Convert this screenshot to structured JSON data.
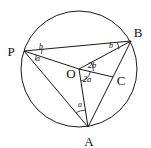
{
  "figure": {
    "kind": "circle-geometry-diagram",
    "background_color": "#ffffff",
    "stroke_color": "#1a1a1a",
    "text_color": "#111111"
  },
  "circle": {
    "center_label": "O",
    "center_x": 79,
    "center_y": 69,
    "radius": 58
  },
  "points": {
    "P": {
      "label": "P",
      "x": 24,
      "y": 51,
      "label_x": 11,
      "label_y": 56
    },
    "B": {
      "label": "B",
      "x": 131,
      "y": 41,
      "label_x": 136,
      "label_y": 37
    },
    "A": {
      "label": "A",
      "x": 88,
      "y": 127,
      "label_x": 84,
      "label_y": 145
    },
    "O": {
      "label": "O",
      "x": 79,
      "y": 69,
      "label_x": 66,
      "label_y": 78
    },
    "C": {
      "label": "C",
      "x": 113,
      "y": 77,
      "label_x": 117,
      "label_y": 85
    }
  },
  "segments": [
    {
      "name": "segment-P-B",
      "from": "P",
      "to": "B"
    },
    {
      "name": "segment-P-O",
      "from": "P",
      "to": "O"
    },
    {
      "name": "segment-P-A",
      "from": "P",
      "to": "A"
    },
    {
      "name": "segment-O-B",
      "from": "O",
      "to": "B"
    },
    {
      "name": "segment-O-A",
      "from": "O",
      "to": "A"
    },
    {
      "name": "segment-O-C",
      "from": "O",
      "to": "C"
    },
    {
      "name": "segment-B-A",
      "from": "B",
      "to": "A"
    }
  ],
  "angles": [
    {
      "name": "angle-at-P-upper",
      "label": "b",
      "vertex": "P",
      "x": 41,
      "y": 48
    },
    {
      "name": "angle-at-P-lower",
      "label": "a",
      "vertex": "P",
      "x": 38,
      "y": 60
    },
    {
      "name": "angle-at-B",
      "label": "b",
      "vertex": "B",
      "x": 111,
      "y": 47
    },
    {
      "name": "angle-at-O-upper",
      "label": "2b",
      "vertex": "O",
      "x": 88,
      "y": 68
    },
    {
      "name": "angle-at-O-lower",
      "label": "2a",
      "vertex": "O",
      "x": 84,
      "y": 82
    },
    {
      "name": "angle-at-A",
      "label": "a",
      "vertex": "A",
      "x": 79,
      "y": 106
    }
  ]
}
